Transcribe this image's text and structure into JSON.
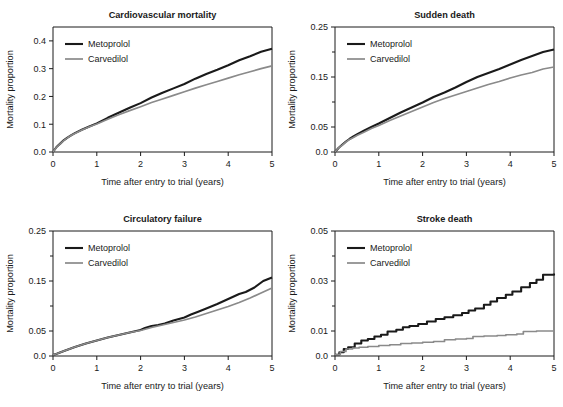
{
  "figure": {
    "background": "#ffffff",
    "panel_count": 4
  },
  "series_style": {
    "metoprolol": {
      "label": "Metoprolol",
      "color": "#1a1a1a",
      "width": 2.1
    },
    "carvedilol": {
      "label": "Carvedilol",
      "color": "#8a8a8a",
      "width": 1.7
    }
  },
  "common": {
    "xlabel": "Time after entry to trial (years)",
    "ylabel": "Mortality proportion",
    "xticks": [
      0,
      1,
      2,
      3,
      4,
      5
    ],
    "xticklabels": [
      "0",
      "1",
      "2",
      "3",
      "4",
      "5"
    ],
    "xlim": [
      0,
      5
    ],
    "grid": false,
    "legend_position": "top-left"
  },
  "chart_data": [
    {
      "type": "line",
      "panel": "cardiovascular-mortality",
      "title": "Cardiovascular mortality",
      "xlabel": "Time after entry to trial (years)",
      "ylabel": "Mortality proportion",
      "xlim": [
        0,
        5
      ],
      "ylim": [
        0,
        0.45
      ],
      "xticks": [
        0,
        1,
        2,
        3,
        4,
        5
      ],
      "xticklabels": [
        "0",
        "1",
        "2",
        "3",
        "4",
        "5"
      ],
      "yticks": [
        0.0,
        0.1,
        0.2,
        0.3,
        0.4
      ],
      "yticklabels": [
        "0.0",
        "0.1",
        "0.2",
        "0.3",
        "0.4"
      ],
      "minor_yticks": [],
      "grid": false,
      "legend": [
        "Metoprolol",
        "Carvedilol"
      ],
      "series": [
        {
          "name": "Metoprolol",
          "color": "#1a1a1a",
          "x": [
            0.0,
            0.08,
            0.17,
            0.25,
            0.33,
            0.42,
            0.5,
            0.67,
            0.83,
            1.0,
            1.25,
            1.5,
            1.75,
            2.0,
            2.25,
            2.5,
            2.75,
            3.0,
            3.25,
            3.5,
            3.75,
            4.0,
            4.25,
            4.5,
            4.75,
            5.0
          ],
          "y": [
            0.0,
            0.018,
            0.031,
            0.043,
            0.052,
            0.061,
            0.068,
            0.081,
            0.092,
            0.103,
            0.123,
            0.141,
            0.159,
            0.176,
            0.196,
            0.213,
            0.229,
            0.245,
            0.264,
            0.281,
            0.296,
            0.312,
            0.33,
            0.345,
            0.361,
            0.372
          ]
        },
        {
          "name": "Carvedilol",
          "color": "#8a8a8a",
          "x": [
            0.0,
            0.08,
            0.17,
            0.25,
            0.33,
            0.42,
            0.5,
            0.67,
            0.83,
            1.0,
            1.25,
            1.5,
            1.75,
            2.0,
            2.25,
            2.5,
            2.75,
            3.0,
            3.25,
            3.5,
            3.75,
            4.0,
            4.25,
            4.5,
            4.75,
            5.0
          ],
          "y": [
            0.0,
            0.017,
            0.03,
            0.042,
            0.051,
            0.06,
            0.067,
            0.08,
            0.091,
            0.101,
            0.118,
            0.134,
            0.149,
            0.163,
            0.178,
            0.191,
            0.204,
            0.217,
            0.23,
            0.242,
            0.254,
            0.266,
            0.278,
            0.289,
            0.3,
            0.31
          ]
        }
      ]
    },
    {
      "type": "line",
      "panel": "sudden-death",
      "title": "Sudden death",
      "xlabel": "Time after entry to trial (years)",
      "ylabel": "Mortality proportion",
      "xlim": [
        0,
        5
      ],
      "ylim": [
        0,
        0.25
      ],
      "xticks": [
        0,
        1,
        2,
        3,
        4,
        5
      ],
      "xticklabels": [
        "0",
        "1",
        "2",
        "3",
        "4",
        "5"
      ],
      "yticks": [
        0.0,
        0.05,
        0.15,
        0.25
      ],
      "yticklabels": [
        "0.0",
        "0.05",
        "0.15",
        "0.25"
      ],
      "minor_yticks": [
        0.1,
        0.2
      ],
      "grid": false,
      "legend": [
        "Metoprolol",
        "Carvedilol"
      ],
      "series": [
        {
          "name": "Metoprolol",
          "color": "#1a1a1a",
          "x": [
            0.0,
            0.08,
            0.17,
            0.25,
            0.33,
            0.42,
            0.5,
            0.67,
            0.83,
            1.0,
            1.25,
            1.5,
            1.75,
            2.0,
            2.25,
            2.5,
            2.75,
            3.0,
            3.25,
            3.5,
            3.75,
            4.0,
            4.25,
            4.5,
            4.75,
            5.0
          ],
          "y": [
            0.0,
            0.008,
            0.015,
            0.021,
            0.026,
            0.031,
            0.035,
            0.043,
            0.05,
            0.057,
            0.068,
            0.079,
            0.089,
            0.099,
            0.11,
            0.119,
            0.129,
            0.14,
            0.15,
            0.158,
            0.166,
            0.175,
            0.184,
            0.192,
            0.2,
            0.205
          ]
        },
        {
          "name": "Carvedilol",
          "color": "#8a8a8a",
          "x": [
            0.0,
            0.08,
            0.17,
            0.25,
            0.33,
            0.42,
            0.5,
            0.67,
            0.83,
            1.0,
            1.25,
            1.5,
            1.75,
            2.0,
            2.25,
            2.5,
            2.75,
            3.0,
            3.25,
            3.5,
            3.75,
            4.0,
            4.25,
            4.5,
            4.75,
            5.0
          ],
          "y": [
            0.0,
            0.008,
            0.014,
            0.02,
            0.025,
            0.029,
            0.033,
            0.04,
            0.047,
            0.053,
            0.063,
            0.072,
            0.081,
            0.09,
            0.099,
            0.107,
            0.114,
            0.121,
            0.128,
            0.135,
            0.141,
            0.148,
            0.154,
            0.159,
            0.166,
            0.17
          ]
        }
      ]
    },
    {
      "type": "line",
      "panel": "circulatory-failure",
      "title": "Circulatory failure",
      "xlabel": "Time after entry to trial (years)",
      "ylabel": "Mortality proportion",
      "xlim": [
        0,
        5
      ],
      "ylim": [
        0,
        0.25
      ],
      "xticks": [
        0,
        1,
        2,
        3,
        4,
        5
      ],
      "xticklabels": [
        "0",
        "1",
        "2",
        "3",
        "4",
        "5"
      ],
      "yticks": [
        0.0,
        0.05,
        0.15,
        0.25
      ],
      "yticklabels": [
        "0.0",
        "0.05",
        "0.15",
        "0.25"
      ],
      "minor_yticks": [
        0.1,
        0.2
      ],
      "grid": false,
      "legend": [
        "Metoprolol",
        "Carvedilol"
      ],
      "series": [
        {
          "name": "Metoprolol",
          "color": "#1a1a1a",
          "x": [
            0.0,
            0.1,
            0.25,
            0.5,
            0.75,
            1.0,
            1.25,
            1.5,
            1.75,
            2.0,
            2.1,
            2.25,
            2.4,
            2.55,
            2.75,
            3.0,
            3.15,
            3.3,
            3.5,
            3.75,
            4.0,
            4.25,
            4.4,
            4.6,
            4.8,
            5.0
          ],
          "y": [
            0.002,
            0.005,
            0.01,
            0.018,
            0.025,
            0.031,
            0.037,
            0.042,
            0.047,
            0.052,
            0.056,
            0.06,
            0.062,
            0.065,
            0.071,
            0.077,
            0.083,
            0.088,
            0.095,
            0.104,
            0.114,
            0.124,
            0.128,
            0.137,
            0.15,
            0.157
          ]
        },
        {
          "name": "Carvedilol",
          "color": "#8a8a8a",
          "x": [
            0.0,
            0.1,
            0.25,
            0.5,
            0.75,
            1.0,
            1.25,
            1.5,
            1.75,
            2.0,
            2.25,
            2.5,
            2.75,
            3.0,
            3.25,
            3.5,
            3.75,
            4.0,
            4.25,
            4.5,
            4.75,
            5.0
          ],
          "y": [
            0.002,
            0.005,
            0.01,
            0.018,
            0.025,
            0.031,
            0.037,
            0.042,
            0.047,
            0.051,
            0.057,
            0.062,
            0.067,
            0.072,
            0.078,
            0.085,
            0.092,
            0.099,
            0.107,
            0.116,
            0.126,
            0.136
          ]
        }
      ]
    },
    {
      "type": "line",
      "panel": "stroke-death",
      "title": "Stroke death",
      "xlabel": "Time after entry to trial (years)",
      "ylabel": "Mortality proportion",
      "xlim": [
        0,
        5
      ],
      "ylim": [
        0,
        0.05
      ],
      "xticks": [
        0,
        1,
        2,
        3,
        4,
        5
      ],
      "xticklabels": [
        "0",
        "1",
        "2",
        "3",
        "4",
        "5"
      ],
      "yticks": [
        0.0,
        0.01,
        0.03,
        0.05
      ],
      "yticklabels": [
        "0.0",
        "0.01",
        "0.03",
        "0.05"
      ],
      "minor_yticks": [
        0.02,
        0.04
      ],
      "grid": false,
      "step": true,
      "legend": [
        "Metoprolol",
        "Carvedilol"
      ],
      "series": [
        {
          "name": "Metoprolol",
          "color": "#1a1a1a",
          "step": true,
          "x": [
            0.0,
            0.1,
            0.2,
            0.3,
            0.45,
            0.6,
            0.75,
            0.9,
            1.05,
            1.2,
            1.4,
            1.55,
            1.7,
            1.9,
            2.1,
            2.3,
            2.5,
            2.7,
            2.9,
            3.05,
            3.2,
            3.4,
            3.55,
            3.7,
            3.9,
            4.05,
            4.25,
            4.45,
            4.6,
            4.75,
            5.0
          ],
          "y": [
            0.0005,
            0.0015,
            0.0028,
            0.0035,
            0.005,
            0.0062,
            0.0068,
            0.0078,
            0.0085,
            0.0098,
            0.0105,
            0.0115,
            0.012,
            0.0128,
            0.0138,
            0.0148,
            0.0155,
            0.0163,
            0.0172,
            0.0182,
            0.019,
            0.0205,
            0.0218,
            0.0232,
            0.0245,
            0.0258,
            0.0275,
            0.0292,
            0.0305,
            0.0325,
            0.033
          ]
        },
        {
          "name": "Carvedilol",
          "color": "#8a8a8a",
          "step": true,
          "x": [
            0.0,
            0.12,
            0.25,
            0.4,
            0.55,
            0.75,
            1.0,
            1.25,
            1.5,
            1.75,
            2.0,
            2.25,
            2.5,
            2.75,
            3.0,
            3.15,
            3.4,
            3.7,
            3.9,
            4.15,
            4.3,
            4.6,
            5.0
          ],
          "y": [
            0.0005,
            0.0018,
            0.0028,
            0.0032,
            0.0035,
            0.0038,
            0.0042,
            0.0045,
            0.005,
            0.0052,
            0.0055,
            0.0058,
            0.0065,
            0.0068,
            0.007,
            0.0078,
            0.008,
            0.0082,
            0.0085,
            0.0088,
            0.0098,
            0.01,
            0.01
          ]
        }
      ]
    }
  ]
}
